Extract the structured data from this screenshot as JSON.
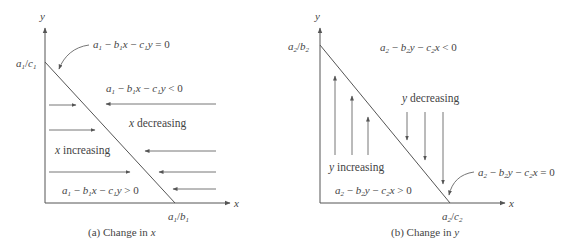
{
  "panel_a": {
    "caption": "(a) Change in x",
    "axis_x": "x",
    "axis_y": "y",
    "y_intercept": "a1/c1",
    "x_intercept": "a1/b1",
    "line_label": "a1 − b1x − c1y = 0",
    "region_above": "a1 − b1x − c1y < 0",
    "region_below": "a1 − b1x − c1y > 0",
    "label_left": "x increasing",
    "label_right": "x decreasing",
    "arrows_right_count": 3,
    "arrows_left_count": 4
  },
  "panel_b": {
    "caption": "(b) Change in y",
    "axis_x": "x",
    "axis_y": "y",
    "y_intercept": "a2/b2",
    "x_intercept": "a2/c2",
    "line_label": "a2 − b2y − c2x = 0",
    "region_above": "a2 − b2y − c2x < 0",
    "region_below": "a2 − b2y − c2x > 0",
    "label_left": "y increasing",
    "label_right": "y decreasing",
    "arrows_up_count": 3,
    "arrows_down_count": 3
  },
  "colors": {
    "line": "#555555",
    "text": "#444444",
    "background": "#ffffff"
  }
}
